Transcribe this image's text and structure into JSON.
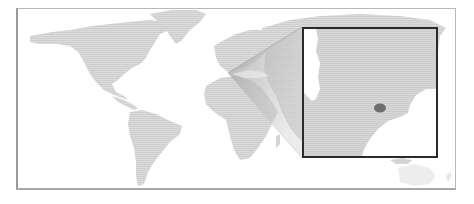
{
  "map": {
    "type": "world-locator-map",
    "style": "dotted grayscale",
    "colors": {
      "background": "#ffffff",
      "land": "#d6d6d6",
      "callout": "#bcbcbc",
      "inset_land": "#d4d4d4",
      "inset_water": "#ffffff",
      "highlight": "#6e6e6e",
      "inset_border": "#2a2a2a",
      "frame_border": "#b0b0b0"
    },
    "inset": {
      "description": "Zoomed inset of the Black Sea / Crimea region with a highlighted area",
      "highlight_label": ""
    },
    "callout_origin": "Black Sea region (Eastern Europe)"
  }
}
